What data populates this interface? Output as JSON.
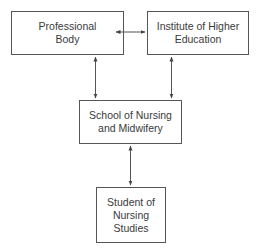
{
  "diagram": {
    "type": "organizational-relationship",
    "nodes": [
      {
        "id": "professional_body",
        "lines": [
          "Professional",
          "Body"
        ]
      },
      {
        "id": "institute",
        "lines": [
          "Institute of Higher",
          "Education"
        ]
      },
      {
        "id": "school",
        "lines": [
          "School of Nursing",
          "and Midwifery"
        ]
      },
      {
        "id": "student",
        "lines": [
          "Student of",
          "Nursing",
          "Studies"
        ]
      }
    ],
    "edges": [
      {
        "from": "professional_body",
        "to": "institute",
        "direction": "bidirectional"
      },
      {
        "from": "professional_body",
        "to": "school",
        "direction": "bidirectional"
      },
      {
        "from": "institute",
        "to": "school",
        "direction": "bidirectional"
      },
      {
        "from": "school",
        "to": "student",
        "direction": "bidirectional"
      }
    ],
    "colors": {
      "line": "#555555",
      "text": "#3a3a3a",
      "background": "#ffffff"
    }
  }
}
